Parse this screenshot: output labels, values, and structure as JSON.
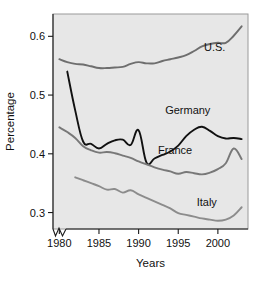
{
  "chart_data": {
    "type": "line",
    "title": "",
    "xlabel": "Years",
    "ylabel": "Percentage",
    "xlim": [
      1979.2,
      2003.8
    ],
    "ylim": [
      0.272,
      0.638
    ],
    "grid": false,
    "legend_position": "inline-end-of-line",
    "axis_break": "x-axis-left-break",
    "xticks": [
      1980,
      1985,
      1990,
      1995,
      2000
    ],
    "xtick_labels": [
      "1980",
      "1985",
      "1990",
      "1995",
      "2000"
    ],
    "yticks": [
      0.3,
      0.4,
      0.5,
      0.6
    ],
    "ytick_labels": [
      "0.3",
      "0.4",
      "0.5",
      "0.6"
    ],
    "series": [
      {
        "name": "U.S.",
        "color": "#6e6e6e",
        "label": "U.S.",
        "label_x": 1999.6,
        "label_y": 0.575,
        "x": [
          1980,
          1981,
          1982,
          1983,
          1984,
          1985,
          1986,
          1987,
          1988,
          1989,
          1990,
          1991,
          1992,
          1993,
          1994,
          1995,
          1996,
          1997,
          1998,
          1999,
          2000,
          2001,
          2002,
          2003
        ],
        "values": [
          0.561,
          0.556,
          0.553,
          0.552,
          0.549,
          0.546,
          0.546,
          0.547,
          0.548,
          0.553,
          0.556,
          0.554,
          0.554,
          0.558,
          0.561,
          0.564,
          0.568,
          0.575,
          0.583,
          0.587,
          0.589,
          0.589,
          0.601,
          0.617
        ]
      },
      {
        "name": "Germany",
        "color": "#111111",
        "label": "Germany",
        "label_x": 1996.2,
        "label_y": 0.468,
        "x": [
          1981,
          1982,
          1983,
          1984,
          1985,
          1986,
          1987,
          1988,
          1989,
          1990,
          1991,
          1992,
          1993,
          1994,
          1995,
          1996,
          1997,
          1998,
          1999,
          2000,
          2001,
          2002,
          2003
        ],
        "values": [
          0.54,
          0.474,
          0.421,
          0.417,
          0.409,
          0.417,
          0.423,
          0.424,
          0.415,
          0.44,
          0.385,
          0.392,
          0.398,
          0.404,
          0.414,
          0.43,
          0.441,
          0.446,
          0.439,
          0.43,
          0.426,
          0.427,
          0.425
        ]
      },
      {
        "name": "France",
        "color": "#787878",
        "label": "France",
        "label_x": 1994.6,
        "label_y": 0.4,
        "x": [
          1980,
          1981,
          1982,
          1983,
          1984,
          1985,
          1986,
          1987,
          1988,
          1989,
          1990,
          1991,
          1992,
          1993,
          1994,
          1995,
          1996,
          1997,
          1998,
          1999,
          2000,
          2001,
          2002,
          2003
        ],
        "values": [
          0.445,
          0.437,
          0.427,
          0.413,
          0.406,
          0.402,
          0.403,
          0.401,
          0.397,
          0.393,
          0.387,
          0.382,
          0.377,
          0.373,
          0.37,
          0.366,
          0.369,
          0.367,
          0.365,
          0.368,
          0.374,
          0.384,
          0.409,
          0.391
        ]
      },
      {
        "name": "Italy",
        "color": "#8c8c8c",
        "label": "Italy",
        "label_x": 1998.6,
        "label_y": 0.312,
        "x": [
          1982,
          1983,
          1984,
          1985,
          1986,
          1987,
          1988,
          1989,
          1990,
          1991,
          1992,
          1993,
          1994,
          1995,
          1996,
          1997,
          1998,
          1999,
          2000,
          2001,
          2002,
          2003
        ],
        "values": [
          0.36,
          0.355,
          0.35,
          0.345,
          0.339,
          0.34,
          0.334,
          0.338,
          0.331,
          0.325,
          0.319,
          0.313,
          0.307,
          0.299,
          0.296,
          0.293,
          0.29,
          0.288,
          0.286,
          0.288,
          0.295,
          0.309
        ]
      }
    ]
  }
}
